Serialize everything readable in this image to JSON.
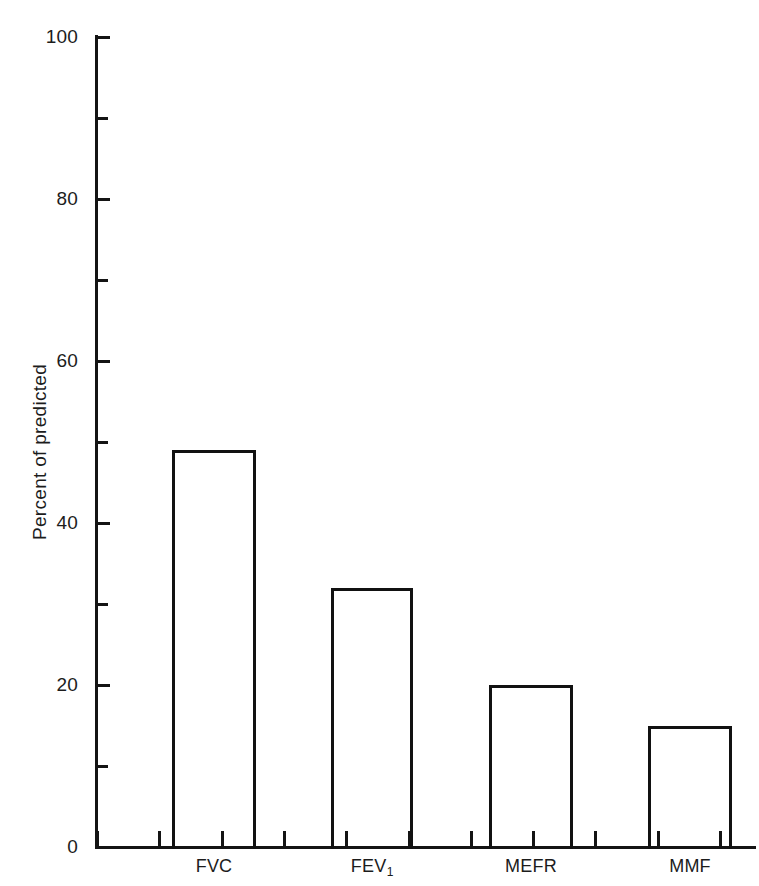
{
  "chart_data": {
    "type": "bar",
    "title": "",
    "xlabel": "",
    "ylabel": "Percent of predicted",
    "categories": [
      "FVC",
      "FEV₁",
      "MEFR",
      "MMF"
    ],
    "values": [
      49,
      32,
      20,
      15
    ],
    "ylim": [
      0,
      100
    ],
    "grid": false,
    "legend": false,
    "y_major_ticks": [
      0,
      20,
      40,
      60,
      80,
      100
    ],
    "y_minor_ticks": [
      10,
      30,
      50,
      70,
      90
    ],
    "y_tick_labels": [
      "0",
      "20",
      "40",
      "60",
      "80",
      "100"
    ],
    "bar_style": "outline",
    "bar_edge_color": "#111111",
    "bar_fill_color": "#ffffff",
    "axis_color": "#141414"
  },
  "axis": {
    "y_title": "Percent of predicted",
    "y_labels": [
      {
        "value": 100,
        "text": "100"
      },
      {
        "value": 80,
        "text": "80"
      },
      {
        "value": 60,
        "text": "60"
      },
      {
        "value": 40,
        "text": "40"
      },
      {
        "value": 20,
        "text": "20"
      },
      {
        "value": 0,
        "text": "0"
      }
    ],
    "x_categories": [
      {
        "label": "FVC",
        "sub": ""
      },
      {
        "label": "FEV",
        "sub": "1"
      },
      {
        "label": "MEFR",
        "sub": ""
      },
      {
        "label": "MMF",
        "sub": ""
      }
    ]
  },
  "bars": [
    {
      "name": "FVC",
      "value": 49
    },
    {
      "name": "FEV1",
      "value": 32
    },
    {
      "name": "MEFR",
      "value": 20
    },
    {
      "name": "MMF",
      "value": 15
    }
  ]
}
